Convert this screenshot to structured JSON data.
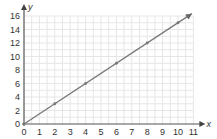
{
  "chart_data": {
    "type": "line",
    "title": "",
    "xlabel": "x",
    "ylabel": "y",
    "xlim": [
      0,
      11
    ],
    "ylim": [
      0,
      16
    ],
    "x_ticks": [
      0,
      1,
      2,
      3,
      4,
      5,
      6,
      7,
      8,
      9,
      10,
      11
    ],
    "y_ticks": [
      0,
      2,
      4,
      6,
      8,
      10,
      12,
      14,
      16
    ],
    "x_tick_labels": [
      "0",
      "1",
      "2",
      "3",
      "4",
      "5",
      "6",
      "7",
      "8",
      "9",
      "10",
      "11"
    ],
    "y_tick_labels": [
      "0",
      "2",
      "4",
      "6",
      "8",
      "10",
      "12",
      "14",
      "16"
    ],
    "grid": true,
    "series": [
      {
        "name": "line",
        "x": [
          0,
          2,
          4,
          6,
          8,
          10
        ],
        "y": [
          0,
          3,
          6,
          9,
          12,
          15
        ],
        "marked_points": true,
        "arrow_end": true,
        "color": "#777777"
      }
    ]
  }
}
